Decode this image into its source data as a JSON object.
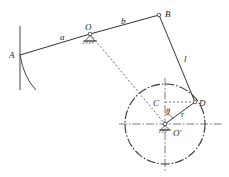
{
  "diagram": {
    "type": "mechanism-linkage",
    "labels": {
      "A": "A",
      "O": "O",
      "B": "B",
      "C": "C",
      "D": "D",
      "O_prime": "O'",
      "a": "a",
      "b": "b",
      "l": "l",
      "r": "r",
      "theta": "θ"
    },
    "colors": {
      "line": "#333333",
      "background": "#ffffff"
    }
  }
}
